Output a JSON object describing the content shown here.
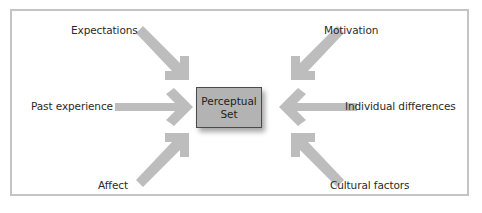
{
  "diagram": {
    "center": {
      "line1": "Perceptual",
      "line2": "Set",
      "fill": "#b3b3b3",
      "border": "#4a4a4a"
    },
    "arrow_color": "#bdbdbd",
    "frame_border": "#c4c4c4",
    "factors": [
      {
        "id": "expectations",
        "label": "Expectations",
        "position": "top-left"
      },
      {
        "id": "motivation",
        "label": "Motivation",
        "position": "top-right"
      },
      {
        "id": "past-experience",
        "label": "Past experience",
        "position": "middle-left"
      },
      {
        "id": "individual-differences",
        "label": "Individual differences",
        "position": "middle-right"
      },
      {
        "id": "affect",
        "label": "Affect",
        "position": "bottom-left"
      },
      {
        "id": "cultural-factors",
        "label": "Cultural factors",
        "position": "bottom-right"
      }
    ]
  }
}
